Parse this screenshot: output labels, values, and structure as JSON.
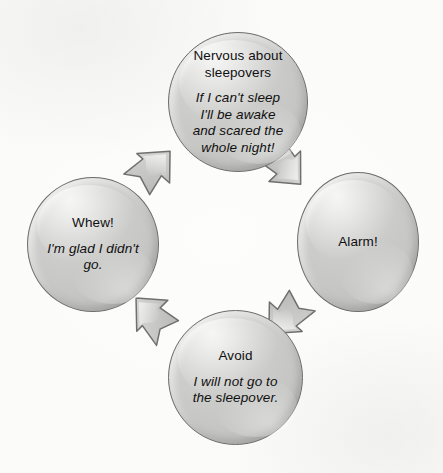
{
  "diagram": {
    "type": "cycle",
    "direction": "clockwise",
    "background_color": "#fdfdfc",
    "node_fill_color": "#c9c9c7",
    "node_border_color": "#6d6d6d",
    "text_color": "#101010",
    "arrow_fill_color": "#c6c6c4",
    "nodes": [
      {
        "id": "nervous",
        "position": "top",
        "title": "Nervous about sleepovers",
        "title_lines": [
          "Nervous about",
          "sleepovers"
        ],
        "detail": "If I can't sleep I'll be awake and scared the whole night!",
        "detail_lines": [
          "If I can't sleep",
          "I'll be awake",
          "and scared the",
          "whole night!"
        ],
        "detail_style": "italic"
      },
      {
        "id": "alarm",
        "position": "right",
        "title": "Alarm!",
        "title_lines": [
          "Alarm!"
        ],
        "detail": "",
        "detail_lines": [],
        "detail_style": "italic"
      },
      {
        "id": "avoid",
        "position": "bottom",
        "title": "Avoid",
        "title_lines": [
          "Avoid"
        ],
        "detail": "I will not go to the sleepover.",
        "detail_lines": [
          "I will not go to",
          "the sleepover."
        ],
        "detail_style": "italic"
      },
      {
        "id": "whew",
        "position": "left",
        "title": "Whew!",
        "title_lines": [
          "Whew!"
        ],
        "detail": "I'm glad I didn't go.",
        "detail_lines": [
          "I'm glad I didn't",
          "go."
        ],
        "detail_style": "italic"
      }
    ],
    "arrows": [
      {
        "id": "nervous-alarm",
        "from": "nervous",
        "to": "alarm",
        "points": "down-right"
      },
      {
        "id": "alarm-avoid",
        "from": "alarm",
        "to": "avoid",
        "points": "down-left"
      },
      {
        "id": "avoid-whew",
        "from": "avoid",
        "to": "whew",
        "points": "up-left"
      },
      {
        "id": "whew-nervous",
        "from": "whew",
        "to": "nervous",
        "points": "up-right"
      }
    ]
  }
}
